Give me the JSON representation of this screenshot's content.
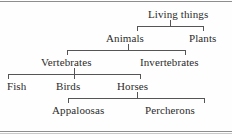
{
  "diagram": {
    "type": "hierarchy-tree",
    "title": "",
    "style": {
      "background": "#fefefe",
      "text_color": "#2b2b2b",
      "line_color": "#555555",
      "rule_color": "#8e8e8e"
    },
    "nodes": [
      {
        "id": "living-things",
        "label": "Living things",
        "level": 0
      },
      {
        "id": "animals",
        "label": "Animals",
        "level": 1
      },
      {
        "id": "plants",
        "label": "Plants",
        "level": 1
      },
      {
        "id": "vertebrates",
        "label": "Vertebrates",
        "level": 2
      },
      {
        "id": "invertebrates",
        "label": "Invertebrates",
        "level": 2
      },
      {
        "id": "fish",
        "label": "Fish",
        "level": 3
      },
      {
        "id": "birds",
        "label": "Birds",
        "level": 3
      },
      {
        "id": "horses",
        "label": "Horses",
        "level": 3
      },
      {
        "id": "appaloosas",
        "label": "Appaloosas",
        "level": 4
      },
      {
        "id": "percherons",
        "label": "Percherons",
        "level": 4
      }
    ],
    "edges": [
      {
        "parent": "living-things",
        "children": [
          "animals",
          "plants"
        ]
      },
      {
        "parent": "animals",
        "children": [
          "vertebrates",
          "invertebrates"
        ]
      },
      {
        "parent": "vertebrates",
        "children": [
          "fish",
          "birds",
          "horses"
        ]
      },
      {
        "parent": "horses",
        "children": [
          "appaloosas",
          "percherons"
        ]
      }
    ]
  }
}
